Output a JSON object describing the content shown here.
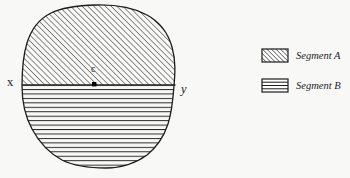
{
  "figure": {
    "background_color": "#f8f8f7",
    "ink_color": "#1c1c1c",
    "width": 350,
    "height": 178
  },
  "shape": {
    "name": "irregular-rounded-region",
    "outline_color": "#1c1c1c",
    "bounds": {
      "left": 22,
      "top": 5,
      "right": 175,
      "bottom": 168
    }
  },
  "divider": {
    "name": "chord-line-xy",
    "y": 85,
    "x_start": 22,
    "x_end": 175
  },
  "labels": {
    "left_endpoint": "x",
    "right_endpoint": "y",
    "center_point": "c"
  },
  "center_marker": {
    "name": "center-point-marker",
    "x": 94,
    "y": 84,
    "size": 4,
    "color": "#000000"
  },
  "segments": [
    {
      "id": "A",
      "label": "Segment A",
      "fill_pattern": "diagonal-hatch",
      "region": "upper"
    },
    {
      "id": "B",
      "label": "Segment B",
      "fill_pattern": "horizontal-lines",
      "region": "lower"
    }
  ],
  "legend": {
    "items": [
      {
        "swatch_pattern": "diagonal-hatch",
        "label": "Segment A"
      },
      {
        "swatch_pattern": "horizontal-lines",
        "label": "Segment B"
      }
    ],
    "swatch": {
      "x": 262,
      "width": 26,
      "height": 13
    },
    "rows_y": [
      49,
      79
    ]
  }
}
